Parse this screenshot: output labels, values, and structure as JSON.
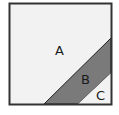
{
  "diagram": {
    "type": "partitioned-square",
    "regions": [
      {
        "label": "A",
        "fill": "#f2f2f2"
      },
      {
        "label": "B",
        "fill": "#7a7a7a"
      },
      {
        "label": "C",
        "fill": "#f2f2f2"
      }
    ],
    "border_color": "#333333"
  }
}
